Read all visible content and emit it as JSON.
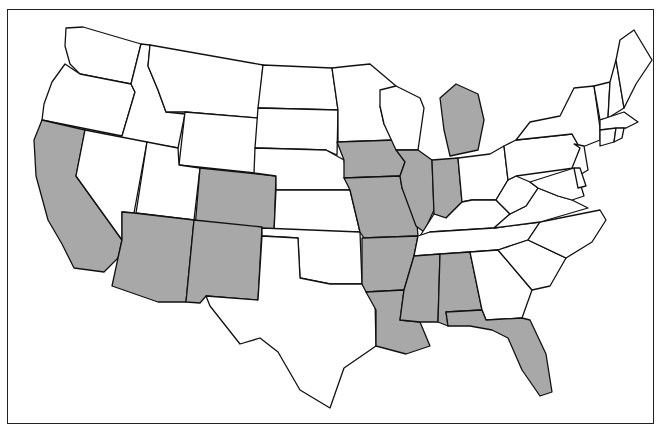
{
  "map": {
    "title": "",
    "region": "Contiguous United States",
    "colors": {
      "shaded": "#a8a8a8",
      "unshaded": "#ffffff",
      "border": "#111111"
    },
    "shaded_states": [
      "California",
      "Arizona",
      "Colorado",
      "New Mexico",
      "Iowa",
      "Missouri",
      "Arkansas",
      "Louisiana",
      "Mississippi",
      "Alabama",
      "Illinois",
      "Indiana",
      "Michigan",
      "Florida"
    ],
    "unshaded_states": [
      "Washington",
      "Oregon",
      "Idaho",
      "Montana",
      "Wyoming",
      "Nevada",
      "Utah",
      "North Dakota",
      "South Dakota",
      "Nebraska",
      "Kansas",
      "Oklahoma",
      "Texas",
      "Minnesota",
      "Wisconsin",
      "Ohio",
      "Kentucky",
      "Tennessee",
      "Georgia",
      "South Carolina",
      "North Carolina",
      "Virginia",
      "West Virginia",
      "Pennsylvania",
      "New York",
      "Vermont",
      "New Hampshire",
      "Maine",
      "Massachusetts",
      "Connecticut",
      "Rhode Island",
      "New Jersey",
      "Delaware",
      "Maryland"
    ]
  }
}
